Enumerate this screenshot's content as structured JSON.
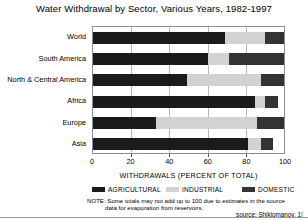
{
  "chart_data": {
    "type": "bar",
    "orientation": "horizontal",
    "stacked": true,
    "title": "Water Withdrawal by Sector, Various Years, 1982-1997",
    "xlabel": "WITHDRAWALS (PERCENT OF TOTAL)",
    "ylabel": "",
    "xlim": [
      0,
      100
    ],
    "xticks": [
      0,
      20,
      40,
      60,
      80,
      100
    ],
    "xtick_labels": [
      "0",
      "20",
      "40",
      "60",
      "80",
      "100"
    ],
    "grid": true,
    "legend_position": "bottom",
    "categories": [
      "World",
      "South America",
      "North & Central America",
      "Africa",
      "Europe",
      "Asia"
    ],
    "series": [
      {
        "name": "AGRICULTURAL",
        "color": "#1b1b1b",
        "values": [
          69,
          60,
          49,
          85,
          33,
          81
        ]
      },
      {
        "name": "INDUSTRIAL",
        "color": "#d2d2d2",
        "values": [
          21,
          11,
          39,
          5,
          53,
          7
        ]
      },
      {
        "name": "DOMESTIC",
        "color": "#333333",
        "values": [
          10,
          29,
          12,
          7,
          14,
          6
        ]
      }
    ],
    "note": "NOTE: Some totals may not add up to 100 due to estimates in the source",
    "note_line2": "data for evaporation from reservoirs.",
    "source": "source: Shiklomanov, 1!"
  }
}
